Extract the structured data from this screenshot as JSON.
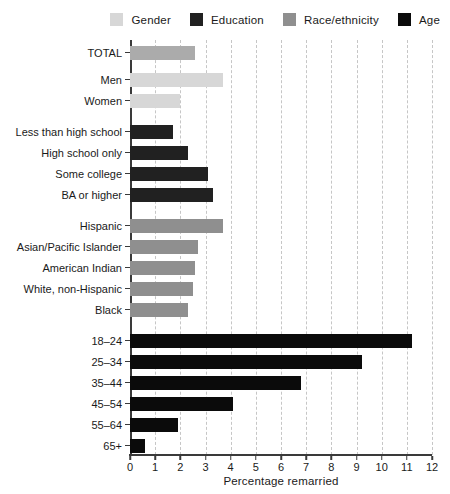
{
  "palette": {
    "total": "#ababab",
    "gender": "#d7d7d7",
    "education": "#212121",
    "race": "#8f8f8f",
    "age": "#0b0b0b",
    "gridline": "#c6c6c6",
    "axis": "#3a3a3a",
    "text": "#1a1a1a"
  },
  "legend": [
    {
      "label": "Gender",
      "series": "gender"
    },
    {
      "label": "Education",
      "series": "education"
    },
    {
      "label": "Race/ethnicity",
      "series": "race"
    },
    {
      "label": "Age",
      "series": "age"
    }
  ],
  "chart_data": {
    "type": "bar",
    "orientation": "horizontal",
    "title": "",
    "xlabel": "Percentage remarried",
    "ylabel": "",
    "xlim": [
      0,
      12
    ],
    "xticks": [
      0,
      1,
      2,
      3,
      4,
      5,
      6,
      7,
      8,
      9,
      10,
      11,
      12
    ],
    "grid": "vertical-dashed",
    "legend_position": "top",
    "groups": [
      {
        "name": "Total and gender",
        "rows": [
          {
            "label": "TOTAL",
            "value": 2.6,
            "series": "total"
          },
          {
            "label": "Men",
            "value": 3.7,
            "series": "gender"
          },
          {
            "label": "Women",
            "value": 2.0,
            "series": "gender"
          }
        ]
      },
      {
        "name": "Education",
        "rows": [
          {
            "label": "Less than high school",
            "value": 1.7,
            "series": "education"
          },
          {
            "label": "High school only",
            "value": 2.3,
            "series": "education"
          },
          {
            "label": "Some college",
            "value": 3.1,
            "series": "education"
          },
          {
            "label": "BA or higher",
            "value": 3.3,
            "series": "education"
          }
        ]
      },
      {
        "name": "Race/ethnicity",
        "rows": [
          {
            "label": "Hispanic",
            "value": 3.7,
            "series": "race"
          },
          {
            "label": "Asian/Pacific Islander",
            "value": 2.7,
            "series": "race"
          },
          {
            "label": "American Indian",
            "value": 2.6,
            "series": "race"
          },
          {
            "label": "White, non-Hispanic",
            "value": 2.5,
            "series": "race"
          },
          {
            "label": "Black",
            "value": 2.3,
            "series": "race"
          }
        ]
      },
      {
        "name": "Age",
        "rows": [
          {
            "label": "18–24",
            "value": 11.2,
            "series": "age"
          },
          {
            "label": "25–34",
            "value": 9.2,
            "series": "age"
          },
          {
            "label": "35–44",
            "value": 6.8,
            "series": "age"
          },
          {
            "label": "45–54",
            "value": 4.1,
            "series": "age"
          },
          {
            "label": "55–64",
            "value": 1.9,
            "series": "age"
          },
          {
            "label": "65+",
            "value": 0.6,
            "series": "age"
          }
        ]
      }
    ]
  }
}
